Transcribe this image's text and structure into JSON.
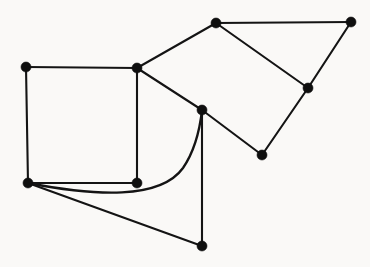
{
  "figure": {
    "kind": "planar-graph-drawing",
    "background_color": "#faf9f7",
    "stroke_color": "#141414",
    "vertex_color": "#0f0f0f",
    "vertex_radius": 5,
    "edge_width": 2.1,
    "width": 370,
    "height": 267,
    "vertex_count": 10,
    "edge_count": 13
  },
  "graph": {
    "vertices": [
      {
        "id": "v1",
        "name": "square-top-left",
        "x": 26,
        "y": 67
      },
      {
        "id": "v2",
        "name": "square-top-right",
        "x": 137,
        "y": 68
      },
      {
        "id": "v3",
        "name": "square-bottom-left",
        "x": 28,
        "y": 183
      },
      {
        "id": "v4",
        "name": "square-bottom-right",
        "x": 137,
        "y": 183
      },
      {
        "id": "v5",
        "name": "center-hub",
        "x": 202,
        "y": 110
      },
      {
        "id": "v6",
        "name": "bottom-spur",
        "x": 202,
        "y": 246
      },
      {
        "id": "v7",
        "name": "upper-apex",
        "x": 216,
        "y": 23
      },
      {
        "id": "v8",
        "name": "far-right-top",
        "x": 351,
        "y": 22
      },
      {
        "id": "v9",
        "name": "right-middle",
        "x": 308,
        "y": 88
      },
      {
        "id": "v10",
        "name": "lower-right",
        "x": 262,
        "y": 155
      }
    ],
    "edges": [
      {
        "id": "e1",
        "from": "v1",
        "to": "v2",
        "type": "straight",
        "d": "M 26 67 L 137 68"
      },
      {
        "id": "e2",
        "from": "v1",
        "to": "v3",
        "type": "straight",
        "d": "M 26 67 L 28 183"
      },
      {
        "id": "e3",
        "from": "v2",
        "to": "v4",
        "type": "straight",
        "d": "M 137 68 L 137 183"
      },
      {
        "id": "e4",
        "from": "v3",
        "to": "v4",
        "type": "straight",
        "d": "M 28 183 L 137 183"
      },
      {
        "id": "e5",
        "from": "v2",
        "to": "v7",
        "type": "straight",
        "d": "M 137 68 L 216 23"
      },
      {
        "id": "e6",
        "from": "v2",
        "to": "v5",
        "type": "straight",
        "d": "M 137 68 L 202 110"
      },
      {
        "id": "e7",
        "from": "v7",
        "to": "v8",
        "type": "straight",
        "d": "M 216 23 L 351 22"
      },
      {
        "id": "e8",
        "from": "v7",
        "to": "v9",
        "type": "straight",
        "d": "M 216 23 L 308 88"
      },
      {
        "id": "e9",
        "from": "v8",
        "to": "v9",
        "type": "straight",
        "d": "M 351 22 L 308 88"
      },
      {
        "id": "e10",
        "from": "v9",
        "to": "v10",
        "type": "straight",
        "d": "M 308 88 L 262 155"
      },
      {
        "id": "e11",
        "from": "v10",
        "to": "v5",
        "type": "straight",
        "d": "M 262 155 L 202 110"
      },
      {
        "id": "e12",
        "from": "v5",
        "to": "v6",
        "type": "straight",
        "d": "M 202 110 L 202 246"
      },
      {
        "id": "e13",
        "from": "v3",
        "to": "v6",
        "type": "straight",
        "d": "M 28 183 L 202 246"
      },
      {
        "id": "e14",
        "from": "v3",
        "to": "v5",
        "type": "curved",
        "d": "M 28 183 C 95 196 160 200 183 168 C 196 149 200 128 202 110"
      }
    ]
  }
}
